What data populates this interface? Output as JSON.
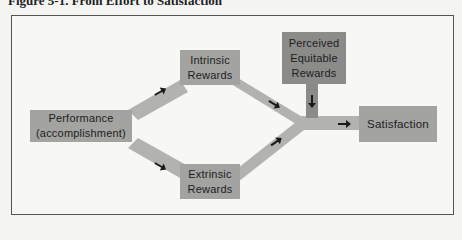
{
  "figure": {
    "caption": "Figure 5-1.  From Effort to Satisfaction"
  },
  "colors": {
    "box_fill": "#a3a3a1",
    "box_fill_dark": "#8b8b89",
    "connector": "#b2b2b0",
    "arrow": "#1a1a1a",
    "frame_border": "#555555",
    "background": "#f7f7f5"
  },
  "nodes": {
    "performance": {
      "line1": "Performance",
      "line2": "(accomplishment)"
    },
    "intrinsic": {
      "line1": "Intrinsic",
      "line2": "Rewards"
    },
    "extrinsic": {
      "line1": "Extrinsic",
      "line2": "Rewards"
    },
    "perceived": {
      "line1": "Perceived",
      "line2": "Equitable",
      "line3": "Rewards"
    },
    "satisfaction": {
      "line1": "Satisfaction"
    }
  },
  "edges": [
    {
      "from": "performance",
      "to": "intrinsic"
    },
    {
      "from": "performance",
      "to": "extrinsic"
    },
    {
      "from": "intrinsic",
      "to": "satisfaction"
    },
    {
      "from": "extrinsic",
      "to": "satisfaction"
    },
    {
      "from": "perceived",
      "to": "satisfaction"
    }
  ]
}
